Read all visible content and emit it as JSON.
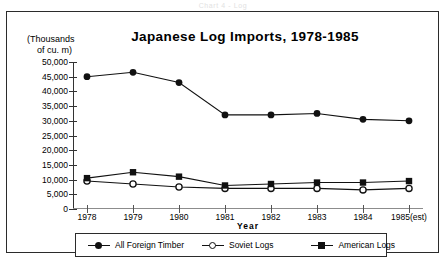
{
  "caption": "Chart 4 - Log",
  "frame": {
    "unit_line1": "(Thousands",
    "unit_line2": "of cu. m)",
    "title": "Japanese  Log  Imports,  1978-1985",
    "xaxis_title": "Year"
  },
  "legend": {
    "items": [
      {
        "label": "All Foreign Timber",
        "marker": "filled-circle-icon",
        "color": "#111111"
      },
      {
        "label": "Soviet Logs",
        "marker": "open-circle-icon",
        "color": "#111111"
      },
      {
        "label": "American Logs",
        "marker": "filled-square-icon",
        "color": "#111111"
      }
    ]
  },
  "chart_data": {
    "type": "line",
    "title": "Japanese  Log  Imports,  1978-1985",
    "subtitle": "(Thousands of cu. m)",
    "xlabel": "Year",
    "ylabel": "(Thousands of cu. m)",
    "categories": [
      "1978",
      "1979",
      "1980",
      "1981",
      "1982",
      "1983",
      "1984",
      "1985(est)"
    ],
    "ylim": [
      0,
      50000
    ],
    "ytick_values": [
      0,
      5000,
      10000,
      15000,
      20000,
      25000,
      30000,
      35000,
      40000,
      45000,
      50000
    ],
    "ytick_labels": [
      "0",
      "5,000",
      "10,000",
      "15,000",
      "20,000",
      "25,000",
      "30,000",
      "35,000",
      "40,000",
      "45,000",
      "50,000"
    ],
    "grid": false,
    "legend_position": "bottom",
    "series": [
      {
        "name": "All Foreign Timber",
        "marker": "filled-circle",
        "values": [
          45000,
          46500,
          43000,
          32000,
          32000,
          32500,
          30500,
          30000
        ]
      },
      {
        "name": "Soviet Logs",
        "marker": "open-circle",
        "values": [
          9500,
          8500,
          7500,
          7000,
          7000,
          7000,
          6500,
          7000
        ]
      },
      {
        "name": "American Logs",
        "marker": "filled-square",
        "values": [
          10500,
          12500,
          11000,
          8000,
          8500,
          9000,
          9000,
          9500
        ]
      }
    ]
  }
}
